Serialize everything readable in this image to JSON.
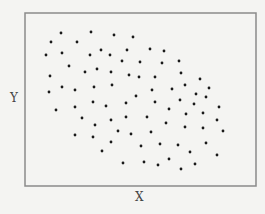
{
  "chart_data": {
    "type": "scatter",
    "title": "",
    "xlabel": "X",
    "ylabel": "Y",
    "xlim": [
      0,
      100
    ],
    "ylim": [
      0,
      100
    ],
    "grid": false,
    "legend": null,
    "ticks": "none",
    "frame": {
      "left": 25,
      "top": 13,
      "right": 256,
      "bottom": 186
    },
    "colors": {
      "background": "#f4f4f2",
      "frame": "#8a8a8a",
      "point": "#1a1a1a",
      "label": "#444444"
    },
    "points_px": [
      [
        61,
        33
      ],
      [
        91,
        32
      ],
      [
        114,
        35
      ],
      [
        133,
        37
      ],
      [
        51,
        42
      ],
      [
        77,
        42
      ],
      [
        46,
        55
      ],
      [
        62,
        53
      ],
      [
        90,
        55
      ],
      [
        101,
        50
      ],
      [
        110,
        55
      ],
      [
        127,
        50
      ],
      [
        150,
        49
      ],
      [
        164,
        51
      ],
      [
        122,
        61
      ],
      [
        140,
        62
      ],
      [
        162,
        63
      ],
      [
        179,
        61
      ],
      [
        69,
        66
      ],
      [
        97,
        69
      ],
      [
        85,
        72
      ],
      [
        111,
        72
      ],
      [
        181,
        73
      ],
      [
        50,
        76
      ],
      [
        129,
        75
      ],
      [
        139,
        77
      ],
      [
        155,
        77
      ],
      [
        200,
        79
      ],
      [
        62,
        87
      ],
      [
        49,
        92
      ],
      [
        75,
        90
      ],
      [
        94,
        87
      ],
      [
        112,
        85
      ],
      [
        152,
        90
      ],
      [
        172,
        89
      ],
      [
        185,
        85
      ],
      [
        209,
        88
      ],
      [
        136,
        96
      ],
      [
        196,
        94
      ],
      [
        206,
        97
      ],
      [
        180,
        100
      ],
      [
        93,
        102
      ],
      [
        75,
        107
      ],
      [
        106,
        106
      ],
      [
        126,
        103
      ],
      [
        155,
        102
      ],
      [
        169,
        109
      ],
      [
        194,
        104
      ],
      [
        219,
        107
      ],
      [
        56,
        110
      ],
      [
        82,
        118
      ],
      [
        111,
        120
      ],
      [
        126,
        117
      ],
      [
        147,
        117
      ],
      [
        186,
        114
      ],
      [
        203,
        113
      ],
      [
        95,
        125
      ],
      [
        166,
        123
      ],
      [
        185,
        127
      ],
      [
        217,
        120
      ],
      [
        203,
        128
      ],
      [
        223,
        131
      ],
      [
        75,
        135
      ],
      [
        93,
        137
      ],
      [
        118,
        131
      ],
      [
        131,
        134
      ],
      [
        151,
        132
      ],
      [
        111,
        142
      ],
      [
        141,
        146
      ],
      [
        160,
        144
      ],
      [
        178,
        145
      ],
      [
        206,
        143
      ],
      [
        102,
        151
      ],
      [
        190,
        152
      ],
      [
        217,
        155
      ],
      [
        123,
        163
      ],
      [
        144,
        162
      ],
      [
        158,
        165
      ],
      [
        169,
        159
      ],
      [
        195,
        164
      ],
      [
        181,
        169
      ]
    ]
  },
  "labels": {
    "x": "X",
    "y": "Y"
  }
}
